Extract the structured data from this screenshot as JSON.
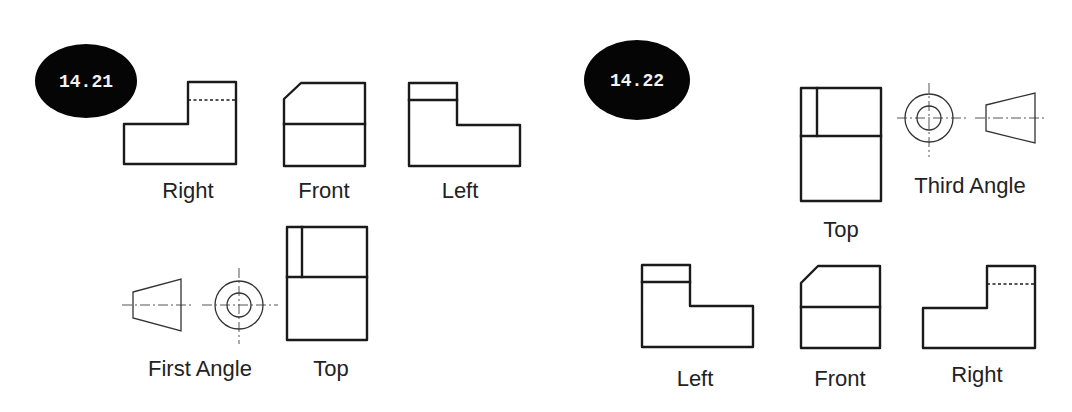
{
  "figures": [
    {
      "id": "14.21",
      "badge": {
        "label": "14.21",
        "cx": 86,
        "cy": 81,
        "rx": 51,
        "ry": 37
      },
      "projection": "First Angle",
      "views": {
        "right": {
          "label": "Right",
          "label_x": 188,
          "label_y": 198
        },
        "front": {
          "label": "Front",
          "label_x": 324,
          "label_y": 198
        },
        "left": {
          "label": "Left",
          "label_x": 460,
          "label_y": 198
        },
        "top": {
          "label": "Top",
          "label_x": 331,
          "label_y": 376
        }
      },
      "symbol": {
        "label": "First Angle",
        "label_x": 200,
        "label_y": 376
      }
    },
    {
      "id": "14.22",
      "badge": {
        "label": "14.22",
        "cx": 637,
        "cy": 80,
        "rx": 53,
        "ry": 40
      },
      "projection": "Third Angle",
      "views": {
        "top": {
          "label": "Top",
          "label_x": 841,
          "label_y": 237
        },
        "left": {
          "label": "Left",
          "label_x": 695,
          "label_y": 386
        },
        "front": {
          "label": "Front",
          "label_x": 840,
          "label_y": 386
        },
        "right": {
          "label": "Right",
          "label_x": 977,
          "label_y": 382
        }
      },
      "symbol": {
        "label": "Third Angle",
        "label_x": 970,
        "label_y": 193
      }
    }
  ],
  "colors": {
    "line": "#1a1a1a",
    "badge": "#050505",
    "badge_text": "#f2f2f2",
    "label": "#222222"
  }
}
